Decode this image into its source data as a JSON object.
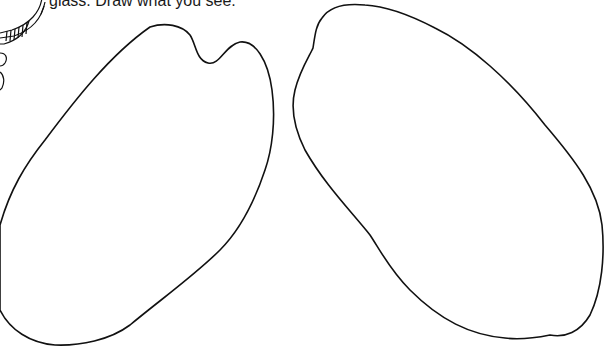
{
  "worksheet": {
    "instruction_text": "glass. Draw what you see.",
    "drawing_areas": [
      {
        "name": "left-drawing-area",
        "shape": "blob-with-notch"
      },
      {
        "name": "right-drawing-area",
        "shape": "oval"
      }
    ],
    "icons": [
      "magnifying-glass-icon"
    ],
    "colors": {
      "ink": "#111111",
      "paper": "#ffffff"
    }
  }
}
